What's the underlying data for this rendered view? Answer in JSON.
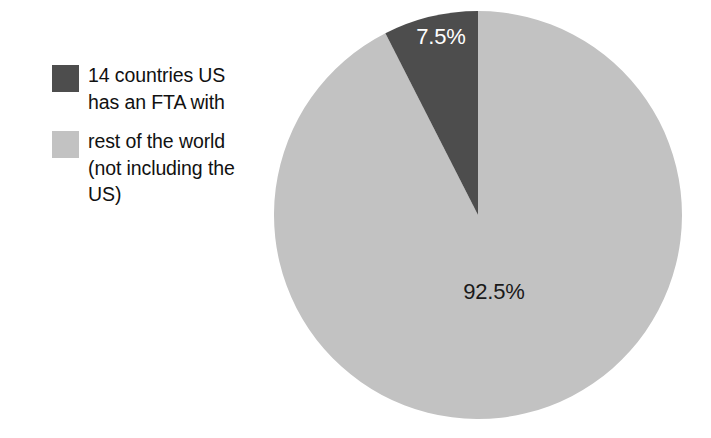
{
  "figure": {
    "background_color": "#ffffff",
    "width": 711,
    "height": 438
  },
  "legend": {
    "position": "left",
    "items": [
      {
        "label": "14 countries US\nhas an FTA with",
        "swatch_color": "#4d4d4d",
        "swatch_name": "legend-swatch-fta-countries"
      },
      {
        "label": "rest of the world\n(not including the\nUS)",
        "swatch_color": "#c2c2c2",
        "swatch_name": "legend-swatch-rest-of-world"
      }
    ]
  },
  "chart_data": {
    "type": "pie",
    "title": "",
    "subtitle": "",
    "xlabel": "",
    "ylabel": "",
    "grid": false,
    "legend_position": "left",
    "start_angle_deg": 0,
    "direction": "counterclockwise",
    "center": {
      "x": 477,
      "y": 214
    },
    "radius": 204,
    "categories": [
      "14 countries US has an FTA with",
      "rest of the world (not including the US)"
    ],
    "values": [
      7.5,
      92.5
    ],
    "value_unit": "%",
    "colors": [
      "#4d4d4d",
      "#c2c2c2"
    ],
    "slices": [
      {
        "name": "14 countries US has an FTA with",
        "value": 7.5,
        "data_label": "7.5%",
        "color": "#4d4d4d",
        "label_color": "#ffffff",
        "label_x": 441,
        "label_y": 44,
        "start_angle_deg": -27,
        "end_angle_deg": 0
      },
      {
        "name": "rest of the world (not including the US)",
        "value": 92.5,
        "data_label": "92.5%",
        "color": "#c2c2c2",
        "label_color": "#1a1a1a",
        "label_x": 494,
        "label_y": 299,
        "start_angle_deg": 0,
        "end_angle_deg": 333
      }
    ]
  }
}
